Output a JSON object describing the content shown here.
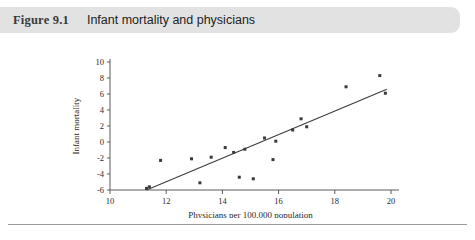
{
  "header": {
    "figure_number": "Figure 9.1",
    "title": "Infant mortality and physicians",
    "bar_color": "#e2e2e2"
  },
  "chart_data": {
    "type": "scatter",
    "title": "Infant mortality and physicians",
    "xlabel": "Physicians per 100,000 population",
    "ylabel": "Infant mortality",
    "xlim": [
      10,
      20
    ],
    "ylim": [
      -6,
      10
    ],
    "xticks": [
      10,
      12,
      14,
      16,
      18,
      20
    ],
    "yticks": [
      -6,
      -4,
      -2,
      0,
      2,
      4,
      6,
      8,
      10
    ],
    "xtick_labels": [
      "10",
      "12",
      "14",
      "16",
      "18",
      "20"
    ],
    "ytick_labels": [
      "-6",
      "-4",
      "-2",
      "0",
      "2",
      "4",
      "6",
      "8",
      "10"
    ],
    "grid": false,
    "legend": "none",
    "marker_color": "#3a3a3a",
    "line_color": "#3c3c3c",
    "points": [
      {
        "x": 11.3,
        "y": -5.8
      },
      {
        "x": 11.4,
        "y": -5.6
      },
      {
        "x": 11.8,
        "y": -2.3
      },
      {
        "x": 12.9,
        "y": -2.1
      },
      {
        "x": 13.2,
        "y": -5.1
      },
      {
        "x": 13.6,
        "y": -1.9
      },
      {
        "x": 14.1,
        "y": -0.7
      },
      {
        "x": 14.4,
        "y": -1.3
      },
      {
        "x": 14.6,
        "y": -4.4
      },
      {
        "x": 14.8,
        "y": -0.9
      },
      {
        "x": 15.1,
        "y": -4.6
      },
      {
        "x": 15.5,
        "y": 0.5
      },
      {
        "x": 15.9,
        "y": 0.1
      },
      {
        "x": 15.8,
        "y": -2.2
      },
      {
        "x": 16.5,
        "y": 1.5
      },
      {
        "x": 16.8,
        "y": 2.9
      },
      {
        "x": 17.0,
        "y": 1.9
      },
      {
        "x": 18.4,
        "y": 6.9
      },
      {
        "x": 19.6,
        "y": 8.3
      },
      {
        "x": 19.8,
        "y": 6.1
      }
    ],
    "regression_line": {
      "x1": 11.3,
      "y1": -6.0,
      "x2": 19.85,
      "y2": 6.6
    }
  }
}
